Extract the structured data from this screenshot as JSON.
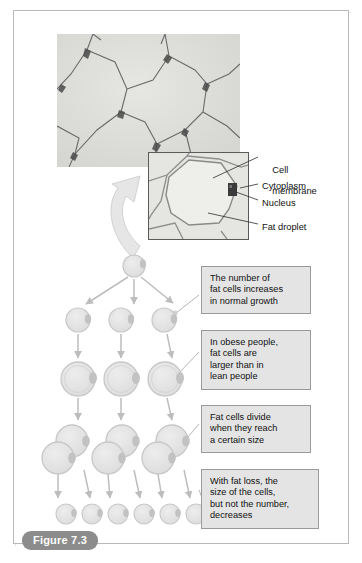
{
  "figure": {
    "tag_label": "Figure 7.3",
    "frame_color": "#b9b9b9"
  },
  "micrograph": {
    "name": "adipose-tissue-micrograph",
    "background_color": "#dcdcd8",
    "membrane_color": "#5f5f5f"
  },
  "inset": {
    "name": "single-fat-cell-inset",
    "background_color": "#e3e3df",
    "border_color": "#5a5a5a",
    "nucleus_color": "#3b3b3b"
  },
  "leader_labels": [
    {
      "id": "cell-membrane",
      "line1": "Cell",
      "line2": "membrane",
      "x": 262,
      "y": 154
    },
    {
      "id": "cytoplasm",
      "line1": "Cytoplasm",
      "line2": "",
      "x": 262,
      "y": 181
    },
    {
      "id": "nucleus",
      "line1": "Nucleus",
      "line2": "",
      "x": 262,
      "y": 198
    },
    {
      "id": "fat-droplet",
      "line1": "Fat droplet",
      "line2": "",
      "x": 262,
      "y": 222
    }
  ],
  "callouts": [
    {
      "id": "callout-growth",
      "text": "The number of\nfat cells increases\nin normal growth",
      "x": 201,
      "y": 266,
      "w": 110,
      "h": 42
    },
    {
      "id": "callout-obesity",
      "text": "In obese people,\nfat cells are\nlarger than in\nlean people",
      "x": 201,
      "y": 330,
      "w": 110,
      "h": 53
    },
    {
      "id": "callout-division",
      "text": "Fat cells divide\nwhen they reach\na certain size",
      "x": 201,
      "y": 405,
      "w": 110,
      "h": 42
    },
    {
      "id": "callout-fatloss",
      "text": "With fat loss, the\nsize of the cells,\nbut not the number,\ndecreases",
      "x": 201,
      "y": 469,
      "w": 118,
      "h": 53
    }
  ],
  "cell_rows": [
    {
      "id": "row-1-single-cell",
      "y": 266,
      "r": 11,
      "cells": [
        {
          "cx": 134
        }
      ]
    },
    {
      "id": "row-2-three-cells",
      "y": 320,
      "r": 12,
      "cells": [
        {
          "cx": 78
        },
        {
          "cx": 121
        },
        {
          "cx": 164
        }
      ]
    },
    {
      "id": "row-3-three-grown-cells",
      "y": 379,
      "r": 17,
      "cells": [
        {
          "cx": 78
        },
        {
          "cx": 121
        },
        {
          "cx": 165
        }
      ]
    },
    {
      "id": "row-4-three-dividing-pairs",
      "y": 448,
      "r": 16,
      "cells": [
        {
          "cx": 72,
          "cy": 441
        },
        {
          "cx": 60,
          "cy": 458
        },
        {
          "cx": 122,
          "cy": 441
        },
        {
          "cx": 110,
          "cy": 458
        },
        {
          "cx": 172,
          "cy": 441
        },
        {
          "cx": 160,
          "cy": 458
        }
      ]
    },
    {
      "id": "row-5-six-small-cells",
      "y": 514,
      "r": 10,
      "cells": [
        {
          "cx": 66
        },
        {
          "cx": 92
        },
        {
          "cx": 118
        },
        {
          "cx": 144
        },
        {
          "cx": 170
        },
        {
          "cx": 196
        }
      ]
    }
  ],
  "colors": {
    "cell_fill": "#e3e3e3",
    "cell_stroke": "#c8c8c8",
    "nucleus_fill": "#c2c2c2",
    "arrow_color": "#bdbdbd",
    "connector_color": "#b5b5b5",
    "curved_arrow_fill": "#e6e6e6",
    "curved_arrow_stroke": "#d2d2d2",
    "callout_bg": "#e4e4e4",
    "callout_border": "#9a9a9a",
    "tag_bg": "#8c8c8c",
    "tag_text": "#ffffff"
  },
  "chart_data": {
    "type": "diagram",
    "stages": [
      {
        "stage": 1,
        "cell_count": 1,
        "cell_size": "small",
        "note": "starting fat cell"
      },
      {
        "stage": 2,
        "cell_count": 3,
        "cell_size": "small",
        "note": "number of fat cells increases in normal growth"
      },
      {
        "stage": 3,
        "cell_count": 3,
        "cell_size": "large",
        "note": "in obese people, fat cells are larger than in lean people"
      },
      {
        "stage": 4,
        "cell_count": 6,
        "cell_size": "large-pairs",
        "note": "fat cells divide when they reach a certain size"
      },
      {
        "stage": 5,
        "cell_count": 6,
        "cell_size": "small",
        "note": "with fat loss, the size of the cells, but not the number, decreases"
      }
    ]
  }
}
